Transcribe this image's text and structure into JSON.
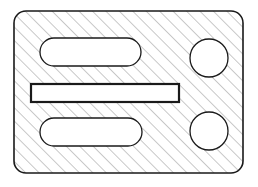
{
  "drawing": {
    "title": "Hatched plate cross-section with slots and holes",
    "type": "engineering-section-view",
    "canvas": {
      "width": 258,
      "height": 187,
      "background": "#ffffff"
    },
    "style": {
      "outline_color": "#1a1a1a",
      "outline_width": 1.6,
      "feature_color": "#1a1a1a",
      "feature_width": 1.3,
      "emphasis_width": 2.2,
      "hatch_color": "#6e6e6e",
      "hatch_width": 0.75,
      "hatch_spacing": 9.5,
      "hatch_angle_deg": 45,
      "fill_color": "#ffffff"
    },
    "body": {
      "name": "outer-plate",
      "shape": "rounded-rectangle",
      "x": 14,
      "y": 11,
      "width": 229,
      "height": 162,
      "corner_radius": 12,
      "hatched": true
    },
    "features": [
      {
        "name": "top-slot",
        "shape": "stadium",
        "x": 40,
        "y": 38,
        "width": 101,
        "height": 28,
        "corner_radius": 14,
        "emphasis": false
      },
      {
        "name": "middle-slot",
        "shape": "rectangle",
        "x": 31,
        "y": 84,
        "width": 148,
        "height": 18,
        "corner_radius": 0,
        "emphasis": true
      },
      {
        "name": "bottom-slot",
        "shape": "stadium",
        "x": 40,
        "y": 118,
        "width": 102,
        "height": 28,
        "corner_radius": 14,
        "emphasis": false
      },
      {
        "name": "top-hole",
        "shape": "circle",
        "cx": 209,
        "cy": 58,
        "r": 19,
        "emphasis": false
      },
      {
        "name": "bottom-hole",
        "shape": "circle",
        "cx": 209,
        "cy": 131,
        "r": 19,
        "emphasis": false
      }
    ]
  }
}
